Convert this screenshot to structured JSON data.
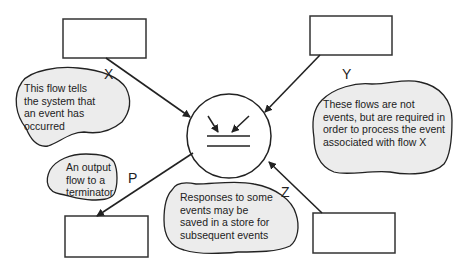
{
  "diagram": {
    "flows": {
      "x": "X",
      "y": "Y",
      "p": "P",
      "z": "Z"
    },
    "notes": {
      "event_flow": "This flow tells the system that an event has occurred",
      "required_flows": "These flows are not events, but are required in order to process the event associated with flow X",
      "output_flow": "An output flow to a terminator",
      "responses_saved": "Responses to some events may be saved in a store for subsequent events"
    },
    "colors": {
      "line": "#222222",
      "cloud_fill": "#ececec",
      "background": "#ffffff"
    }
  }
}
